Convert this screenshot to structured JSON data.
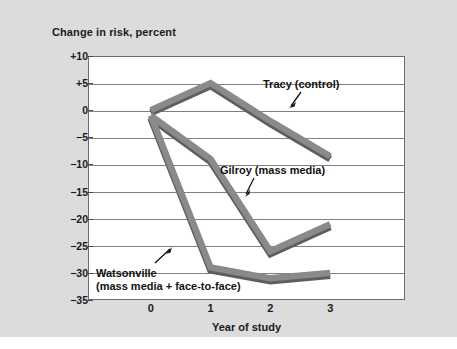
{
  "chart_data": {
    "type": "line",
    "title": "",
    "xlabel": "Year of study",
    "ylabel": "Change in risk, percent",
    "x": [
      0,
      1,
      2,
      3
    ],
    "xticklabels": [
      "0",
      "1",
      "2",
      "3"
    ],
    "yticklabels": [
      "+10",
      "+5",
      "0",
      "−5",
      "−10",
      "−15",
      "−20",
      "−25",
      "−30",
      "−35"
    ],
    "ytickvalues": [
      10,
      5,
      0,
      -5,
      -10,
      -15,
      -20,
      -25,
      -30,
      -35
    ],
    "xlim": [
      -1.05,
      4.25
    ],
    "ylim": [
      -35,
      10
    ],
    "grid": "horizontal",
    "legend": "none (inline annotations)",
    "series": [
      {
        "name": "Tracy (control)",
        "values": [
          0,
          5,
          -2,
          -8.5
        ],
        "color": "#8a8a8a"
      },
      {
        "name": "Gilroy (mass media)",
        "values": [
          -1,
          -9,
          -26,
          -21
        ],
        "color": "#8a8a8a"
      },
      {
        "name": "Watsonville (mass media + face-to-face)",
        "values": [
          -1,
          -29,
          -31,
          -30
        ],
        "color": "#8a8a8a"
      }
    ],
    "annotations": [
      {
        "id": "tracy",
        "text": "Tracy (control)",
        "lines": [
          "Tracy (control)"
        ]
      },
      {
        "id": "gilroy",
        "text": "Gilroy (mass media)",
        "lines": [
          "Gilroy (mass media)"
        ]
      },
      {
        "id": "watsonville",
        "text": "Watsonville (mass media + face-to-face)",
        "lines": [
          "Watsonville",
          "(mass media + face-to-face)"
        ]
      }
    ]
  },
  "axes": {
    "ylabel": "Change in risk, percent",
    "xlabel": "Year of study",
    "yticks": [
      {
        "label": "+10"
      },
      {
        "label": "+5"
      },
      {
        "label": "0"
      },
      {
        "label": "−5"
      },
      {
        "label": "−10"
      },
      {
        "label": "−15"
      },
      {
        "label": "−20"
      },
      {
        "label": "−25"
      },
      {
        "label": "−30"
      },
      {
        "label": "−35"
      }
    ],
    "xticks": [
      {
        "label": "0"
      },
      {
        "label": "1"
      },
      {
        "label": "2"
      },
      {
        "label": "3"
      }
    ]
  },
  "annotations": {
    "tracy": "Tracy (control)",
    "gilroy": "Gilroy (mass media)",
    "watsonville_line1": "Watsonville",
    "watsonville_line2": "(mass media + face-to-face)"
  },
  "colors": {
    "panel_background": "#dcdcdc",
    "plot_background": "#ffffff",
    "gridline": "#808080",
    "plot_border": "#6e6e6e",
    "ribbon_face": "#8a8a8a",
    "ribbon_shadow": "#5e5e5e",
    "text": "#1a1a1a"
  }
}
